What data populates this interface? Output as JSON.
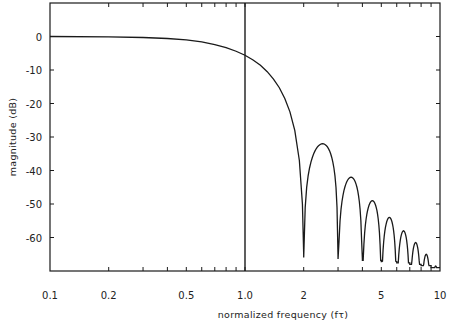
{
  "chart_data": {
    "type": "line",
    "title": "",
    "xlabel": "normalized frequency (fτ)",
    "ylabel": "magnitude (dB)",
    "xscale": "log",
    "xlim": [
      0.1,
      10
    ],
    "ylim": [
      -70,
      10
    ],
    "x_ticks": [
      {
        "value": 0.1,
        "label": "0.1"
      },
      {
        "value": 0.2,
        "label": "0.2"
      },
      {
        "value": 0.5,
        "label": "0.5"
      },
      {
        "value": 1.0,
        "label": "1.0"
      },
      {
        "value": 2,
        "label": "2"
      },
      {
        "value": 5,
        "label": "5"
      },
      {
        "value": 10,
        "label": "10"
      }
    ],
    "y_ticks": [
      {
        "value": 0,
        "label": "0"
      },
      {
        "value": -10,
        "label": "-10"
      },
      {
        "value": -20,
        "label": "-20"
      },
      {
        "value": -30,
        "label": "-30"
      },
      {
        "value": -40,
        "label": "-40"
      },
      {
        "value": -50,
        "label": "-50"
      },
      {
        "value": -60,
        "label": "-60"
      }
    ],
    "grid": false,
    "reference_line": {
      "x": 1.0,
      "orientation": "vertical"
    },
    "series": [
      {
        "name": "magnitude response",
        "mainlobe": [
          [
            0.1,
            0.0
          ],
          [
            0.2,
            -0.1
          ],
          [
            0.3,
            -0.3
          ],
          [
            0.4,
            -0.6
          ],
          [
            0.5,
            -1.0
          ],
          [
            0.6,
            -1.6
          ],
          [
            0.7,
            -2.4
          ],
          [
            0.8,
            -3.3
          ],
          [
            0.9,
            -4.4
          ],
          [
            1.0,
            -5.6
          ],
          [
            1.1,
            -7.0
          ],
          [
            1.2,
            -8.6
          ],
          [
            1.3,
            -10.5
          ],
          [
            1.4,
            -12.7
          ],
          [
            1.5,
            -15.3
          ],
          [
            1.6,
            -18.5
          ],
          [
            1.7,
            -22.5
          ],
          [
            1.8,
            -28.0
          ],
          [
            1.9,
            -37.0
          ],
          [
            1.97,
            -50.0
          ],
          [
            2.0,
            -65.0
          ]
        ],
        "nulls": [
          2,
          3,
          4,
          5,
          6,
          7,
          8,
          9,
          10
        ],
        "sidelobe_peaks": [
          {
            "x": 2.4,
            "y": -32
          },
          {
            "x": 3.45,
            "y": -42
          },
          {
            "x": 4.45,
            "y": -49
          },
          {
            "x": 5.45,
            "y": -54
          },
          {
            "x": 6.45,
            "y": -58
          },
          {
            "x": 7.45,
            "y": -61.5
          },
          {
            "x": 8.45,
            "y": -65
          },
          {
            "x": 9.45,
            "y": -68.5
          }
        ]
      }
    ]
  }
}
